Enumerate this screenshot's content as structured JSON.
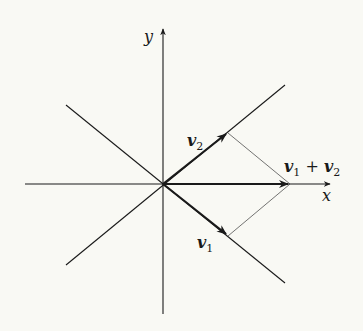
{
  "diagram": {
    "background": "#f9f9f4",
    "stroke_color": "#1a1a1a",
    "axes": {
      "x_label": "x",
      "y_label": "y"
    },
    "labels": {
      "v1": "v",
      "v1_sub": "1",
      "v2": "v",
      "v2_sub": "2",
      "sum_v1": "v",
      "sum_v1_sub": "1",
      "sum_plus": " + ",
      "sum_v2": "v",
      "sum_v2_sub": "2"
    },
    "elements": [
      {
        "name": "x-axis",
        "type": "axis-arrow"
      },
      {
        "name": "y-axis",
        "type": "axis-arrow"
      },
      {
        "name": "diagonal-line-positive-slope",
        "type": "line"
      },
      {
        "name": "diagonal-line-negative-slope",
        "type": "line"
      },
      {
        "name": "vector-v1",
        "type": "bold-arrow"
      },
      {
        "name": "vector-v2",
        "type": "bold-arrow"
      },
      {
        "name": "vector-sum",
        "type": "bold-arrow"
      },
      {
        "name": "parallelogram-edge-upper",
        "type": "thin-line"
      },
      {
        "name": "parallelogram-edge-lower",
        "type": "thin-line"
      }
    ]
  }
}
